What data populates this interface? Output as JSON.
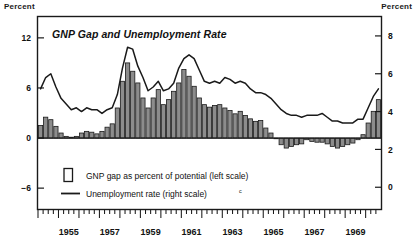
{
  "figure": {
    "title": "GNP Gap and Unemployment Rate",
    "unit_left": "Percent",
    "unit_right": "Percent"
  },
  "legend": {
    "items": [
      {
        "marker": "open-rectangle-swatch",
        "label": "GNP gap as percent of potential (left scale)"
      },
      {
        "marker": "line-swatch",
        "label": "Unemployment rate (right scale)",
        "footnote": "c"
      }
    ]
  },
  "chart_data": {
    "type": "bar",
    "title": "GNP Gap and Unemployment Rate",
    "xlabel": "",
    "ylabel": "Percent",
    "grid": false,
    "legend_position": "inside-bottom-left",
    "x_tick_labels": [
      "1955",
      "1957",
      "1959",
      "1961",
      "1963",
      "1965",
      "1967",
      "1969"
    ],
    "x_minor_tick_interval": "quarter",
    "x_range": [
      "1954Q1",
      "1970Q4"
    ],
    "axes": {
      "left": {
        "label": "Percent",
        "ticks": [
          12,
          6,
          0,
          -6
        ],
        "ylim": [
          -8.5,
          14.5
        ],
        "series": "GNP gap as percent of potential"
      },
      "right": {
        "label": "Percent",
        "ticks": [
          8,
          6,
          4,
          2,
          0
        ],
        "ylim": [
          -1.15,
          9.0
        ],
        "series": "Unemployment rate"
      }
    },
    "x": [
      "1954Q1",
      "1954Q2",
      "1954Q3",
      "1954Q4",
      "1955Q1",
      "1955Q2",
      "1955Q3",
      "1955Q4",
      "1956Q1",
      "1956Q2",
      "1956Q3",
      "1956Q4",
      "1957Q1",
      "1957Q2",
      "1957Q3",
      "1957Q4",
      "1958Q1",
      "1958Q2",
      "1958Q3",
      "1958Q4",
      "1959Q1",
      "1959Q2",
      "1959Q3",
      "1959Q4",
      "1960Q1",
      "1960Q2",
      "1960Q3",
      "1960Q4",
      "1961Q1",
      "1961Q2",
      "1961Q3",
      "1961Q4",
      "1962Q1",
      "1962Q2",
      "1962Q3",
      "1962Q4",
      "1963Q1",
      "1963Q2",
      "1963Q3",
      "1963Q4",
      "1964Q1",
      "1964Q2",
      "1964Q3",
      "1964Q4",
      "1965Q1",
      "1965Q2",
      "1965Q3",
      "1965Q4",
      "1966Q1",
      "1966Q2",
      "1966Q3",
      "1966Q4",
      "1967Q1",
      "1967Q2",
      "1967Q3",
      "1967Q4",
      "1968Q1",
      "1968Q2",
      "1968Q3",
      "1968Q4",
      "1969Q1",
      "1969Q2",
      "1969Q3",
      "1969Q4",
      "1970Q1",
      "1970Q2",
      "1970Q3"
    ],
    "series": [
      {
        "name": "GNP gap as percent of potential (left scale)",
        "axis": "left",
        "kind": "bar",
        "fill": "#8c8c8c",
        "edge": "#1a1a1a",
        "values": [
          1.5,
          2.5,
          2.2,
          1.4,
          0.6,
          0.2,
          0.1,
          0.2,
          0.6,
          0.8,
          0.7,
          0.5,
          0.8,
          1.3,
          1.7,
          3.6,
          6.8,
          9.0,
          8.0,
          6.6,
          4.8,
          3.6,
          4.8,
          5.8,
          4.0,
          4.6,
          5.6,
          6.6,
          8.2,
          7.4,
          6.2,
          4.8,
          4.0,
          3.7,
          3.9,
          4.0,
          3.6,
          3.3,
          2.9,
          3.2,
          2.7,
          2.3,
          2.0,
          2.1,
          1.2,
          0.6,
          0.0,
          -0.8,
          -1.2,
          -1.0,
          -0.8,
          -0.7,
          -0.2,
          -0.4,
          -0.5,
          -0.5,
          -0.7,
          -1.0,
          -1.2,
          -1.0,
          -0.8,
          -0.6,
          -0.2,
          0.4,
          1.8,
          3.2,
          4.6
        ]
      },
      {
        "name": "Unemployment rate (right scale)",
        "axis": "right",
        "kind": "line",
        "color": "#1a1a1a",
        "values": [
          5.2,
          5.8,
          6.0,
          5.3,
          4.7,
          4.4,
          4.1,
          4.2,
          4.0,
          4.2,
          4.1,
          4.1,
          3.9,
          4.1,
          4.2,
          4.9,
          6.3,
          7.4,
          7.3,
          6.4,
          5.8,
          5.1,
          5.3,
          5.6,
          5.1,
          5.2,
          5.5,
          6.3,
          6.8,
          7.0,
          6.8,
          6.2,
          5.6,
          5.5,
          5.6,
          5.5,
          5.8,
          5.7,
          5.5,
          5.6,
          5.5,
          5.2,
          5.0,
          5.0,
          4.9,
          4.7,
          4.4,
          4.1,
          3.9,
          3.8,
          3.8,
          3.7,
          3.8,
          3.8,
          3.8,
          3.9,
          3.7,
          3.5,
          3.5,
          3.4,
          3.4,
          3.4,
          3.6,
          3.6,
          4.2,
          4.8,
          5.2
        ]
      }
    ]
  }
}
